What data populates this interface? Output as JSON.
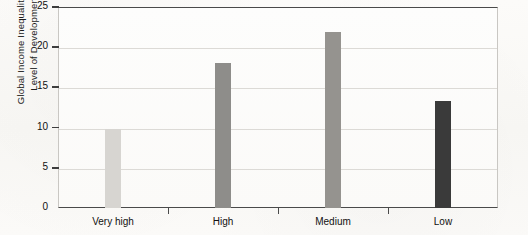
{
  "chart_data": {
    "type": "bar",
    "title": "",
    "subtitle": "",
    "xlabel": "",
    "ylabel": "Global Income Inequality by\nLevel of Development",
    "categories": [
      "Very high",
      "High",
      "Medium",
      "Low"
    ],
    "values": [
      9.8,
      18.0,
      21.9,
      13.3
    ],
    "series": [
      {
        "name": "Global Income Inequality by Level of Development",
        "values": [
          9.8,
          18.0,
          21.9,
          13.3
        ]
      }
    ],
    "ylim": [
      0,
      25
    ],
    "ytick_values": [
      0,
      5,
      10,
      15,
      20,
      25
    ],
    "ytick_labels": [
      "0",
      "5",
      "10",
      "15",
      "20",
      "25"
    ],
    "grid": "horizontal",
    "legend": "none",
    "bar_colors": [
      "#d7d5d1",
      "#8e8d8a",
      "#95938f",
      "#3a3a3a"
    ],
    "plot_background": "#fbfaf8",
    "gridline_color": "#dcdad6",
    "axis_color": "#4a4a4a"
  }
}
